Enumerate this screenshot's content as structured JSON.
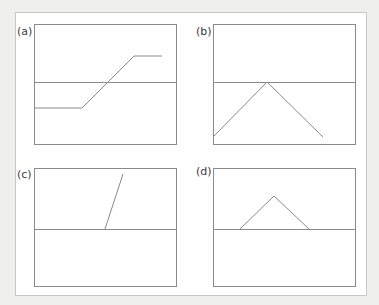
{
  "figure": {
    "panels": [
      {
        "label": "(a)",
        "shape": "ramp-step",
        "points": [
          [
            34,
            108
          ],
          [
            82,
            108
          ],
          [
            134,
            56
          ],
          [
            162,
            56
          ]
        ],
        "box": [
          34,
          24,
          176,
          144
        ],
        "midline_y": 82
      },
      {
        "label": "(b)",
        "shape": "triangle-peak-on-axis",
        "points": [
          [
            214,
            136
          ],
          [
            267,
            82
          ],
          [
            323,
            137
          ]
        ],
        "box": [
          214,
          24,
          356,
          144
        ],
        "midline_y": 82
      },
      {
        "label": "(c)",
        "shape": "steep-line-from-axis",
        "points": [
          [
            105,
            229
          ],
          [
            123,
            174
          ]
        ],
        "box": [
          34,
          168,
          176,
          287
        ],
        "midline_y": 229
      },
      {
        "label": "(d)",
        "shape": "triangle-above-axis",
        "points": [
          [
            240,
            229
          ],
          [
            274,
            196
          ],
          [
            309,
            229
          ]
        ],
        "box": [
          214,
          168,
          356,
          287
        ],
        "midline_y": 229
      }
    ],
    "colors": {
      "line": "#8a8a8a",
      "box": "#8a8a8a",
      "background": "#efefed",
      "sheet": "#ffffff"
    }
  }
}
